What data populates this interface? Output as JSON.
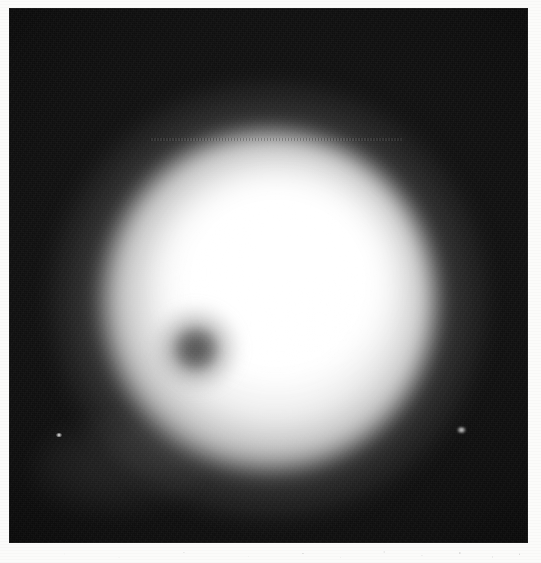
{
  "image": {
    "kind": "scanned-photographic-plate",
    "subject_label": "defocused luminous disk with dark spot",
    "width_px": 541,
    "height_px": 563,
    "orientation": "portrait"
  },
  "margin": {
    "name": "white scan margin",
    "color": "#fbfbfa",
    "bottom_strip_height_px": 20,
    "artifact_label": "scanner dust specks"
  },
  "plate": {
    "name": "photographic plate",
    "background_color": "#090909",
    "base_color": "#151515",
    "left_px": 9,
    "top_px": 8,
    "width_px": 519,
    "height_px": 535,
    "grain_label": "film grain"
  },
  "disk": {
    "name": "luminous disk",
    "center_x_px": 269,
    "center_y_px": 301,
    "radius_px": 166,
    "halo_radius_px": 215,
    "core_color": "#ffffff",
    "limb_color": "#d6d6d6",
    "halo_color": "#8c8c8c"
  },
  "core": {
    "name": "saturated core",
    "center_x_px": 294,
    "center_y_px": 271,
    "radius_px": 66,
    "color": "#ffffff"
  },
  "core_knot": {
    "name": "secondary brightness knot",
    "center_x_px": 311,
    "center_y_px": 324,
    "radius_px": 39
  },
  "spot": {
    "name": "dark spot",
    "center_x_px": 196,
    "center_y_px": 349,
    "umbra_radius_px": 22,
    "penumbra_radius_px": 41,
    "umbra_color": "#161616",
    "penumbra_color": "#464646"
  },
  "artifacts": {
    "scanline": {
      "name": "dotted scan line",
      "x_px": 150,
      "y_px": 138,
      "length_px": 252,
      "color": "#000000"
    },
    "fog_patch": {
      "name": "diffuse fog patch",
      "center_x_px": 117,
      "center_y_px": 468,
      "width_px": 172,
      "height_px": 96
    },
    "specks": [
      {
        "name": "bright speck left",
        "x_px": 59,
        "y_px": 436,
        "size_px": 6
      },
      {
        "name": "bright speck right",
        "x_px": 461,
        "y_px": 431,
        "size_px": 9
      }
    ]
  }
}
